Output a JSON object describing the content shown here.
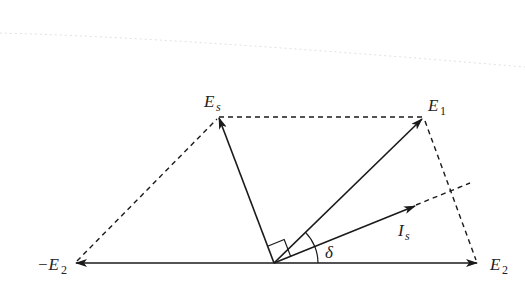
{
  "figure": {
    "type": "phasor-diagram",
    "stroke_color": "#1a1a1a",
    "background": "#ffffff"
  },
  "points": {
    "origin": {
      "x": 274,
      "y": 263
    },
    "E_s": {
      "x": 219,
      "y": 117
    },
    "E_1": {
      "x": 423,
      "y": 118
    },
    "neg_E_2": {
      "x": 75,
      "y": 263
    },
    "E_2": {
      "x": 478,
      "y": 263
    },
    "I_s_tip": {
      "x": 415,
      "y": 206
    },
    "I_s_dash_end": {
      "x": 470,
      "y": 183
    }
  },
  "labels": {
    "E_s": {
      "main": "E",
      "sub": "s"
    },
    "E_1": {
      "main": "E",
      "sub": "1"
    },
    "neg_E_2": {
      "main": "−E",
      "sub": "2"
    },
    "E_2": {
      "main": "E",
      "sub": "2"
    },
    "I_s": {
      "main": "I",
      "sub": "s"
    },
    "delta": "δ"
  },
  "annotations": {
    "right_angle_marker": "between E_s and E_1 at origin",
    "angle_delta": "between E_2 axis and I_s"
  }
}
